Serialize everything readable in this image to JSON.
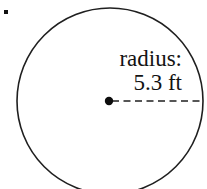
{
  "figure": {
    "type": "geometry-diagram",
    "background_color": "#ffffff",
    "stroke_color": "#1a1a1a",
    "text_color": "#131313",
    "width": 207,
    "height": 189
  },
  "bullet": {
    "name": "list-bullet",
    "shape": "square-dot",
    "color": "#111111",
    "x": 4,
    "y": 10,
    "size": 4
  },
  "circle": {
    "name": "outline-circle",
    "center_x": 110,
    "center_y": 101,
    "radius": 93,
    "stroke_color": "#1f1f1f",
    "stroke_width": 1.6,
    "fill": "none"
  },
  "center_point": {
    "name": "center-dot",
    "x": 109,
    "y": 101,
    "radius": 4.2,
    "fill": "#0d0d0d"
  },
  "radius_line": {
    "name": "radius-dashed-line",
    "x1": 112,
    "y1": 101,
    "x2": 203,
    "y2": 101,
    "style": "dashed",
    "dash_pattern": "7 4.5",
    "stroke_color": "#1f1f1f",
    "stroke_width": 1.7
  },
  "label": {
    "name": "radius-label",
    "line1": "radius:",
    "line2": "5.3 ft",
    "value": "5.3",
    "unit": "ft",
    "align": "right",
    "font_size": "23px"
  }
}
